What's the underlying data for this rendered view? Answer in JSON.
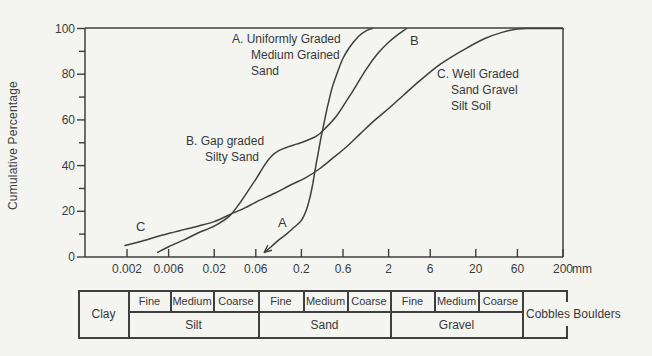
{
  "chart": {
    "ylabel": "Cumulative Percentage",
    "x_unit": "mm",
    "curve_letters": {
      "a": "A",
      "b": "B",
      "c": "C"
    },
    "labels": {
      "a_line1": "A. Uniformly Graded",
      "a_line2": "Medium Grained",
      "a_line3": "Sand",
      "b_line1": "B. Gap graded",
      "b_line2": "Silty Sand",
      "c_line1": "C. Well Graded",
      "c_line2": "Sand Gravel",
      "c_line3": "Silt Soil"
    }
  },
  "chart_data": {
    "type": "line",
    "title": "",
    "xlabel": "mm",
    "ylabel": "Cumulative Percentage",
    "x_scale": "log",
    "xlim": [
      0.00066,
      216
    ],
    "ylim": [
      0,
      100
    ],
    "grid": false,
    "x_ticks": [
      0.002,
      0.006,
      0.02,
      0.06,
      0.2,
      0.6,
      2,
      6,
      20,
      60,
      200
    ],
    "x_tick_labels": [
      "0.002",
      "0.006",
      "0.02",
      "0.06",
      "0.2",
      "0.6",
      "2",
      "6",
      "20",
      "60",
      "200"
    ],
    "y_major_ticks": [
      0,
      20,
      40,
      60,
      80,
      100
    ],
    "y_minor_step": 10,
    "series": [
      {
        "name": "A",
        "label": "A. Uniformly Graded Medium Grained Sand",
        "arrow_at_start": true,
        "points": [
          [
            0.075,
            2
          ],
          [
            0.09,
            4.5
          ],
          [
            0.11,
            7.5
          ],
          [
            0.135,
            10
          ],
          [
            0.165,
            13
          ],
          [
            0.2,
            16
          ],
          [
            0.23,
            21
          ],
          [
            0.25,
            26
          ],
          [
            0.27,
            32
          ],
          [
            0.29,
            39
          ],
          [
            0.31,
            45
          ],
          [
            0.335,
            52
          ],
          [
            0.365,
            59
          ],
          [
            0.4,
            66
          ],
          [
            0.45,
            74
          ],
          [
            0.52,
            81
          ],
          [
            0.6,
            87
          ],
          [
            0.72,
            92
          ],
          [
            0.9,
            96.5
          ],
          [
            1.1,
            99
          ],
          [
            1.3,
            100
          ]
        ]
      },
      {
        "name": "B",
        "label": "B. Gap graded Silty Sand",
        "arrow_at_start": false,
        "points": [
          [
            0.0045,
            2
          ],
          [
            0.006,
            4.5
          ],
          [
            0.009,
            7.5
          ],
          [
            0.013,
            10.5
          ],
          [
            0.02,
            13.5
          ],
          [
            0.03,
            18
          ],
          [
            0.04,
            24
          ],
          [
            0.05,
            29.5
          ],
          [
            0.06,
            34
          ],
          [
            0.075,
            40
          ],
          [
            0.09,
            44
          ],
          [
            0.11,
            46.5
          ],
          [
            0.14,
            48.2
          ],
          [
            0.18,
            49.5
          ],
          [
            0.23,
            51
          ],
          [
            0.3,
            53
          ],
          [
            0.38,
            56.5
          ],
          [
            0.5,
            61.5
          ],
          [
            0.65,
            68
          ],
          [
            0.85,
            75
          ],
          [
            1.1,
            82
          ],
          [
            1.5,
            89
          ],
          [
            2,
            94
          ],
          [
            2.6,
            97.5
          ],
          [
            3.2,
            100
          ]
        ]
      },
      {
        "name": "C",
        "label": "C. Well Graded Sand Gravel Silt Soil",
        "arrow_at_start": false,
        "points": [
          [
            0.0019,
            5
          ],
          [
            0.003,
            7
          ],
          [
            0.005,
            9.5
          ],
          [
            0.008,
            11.5
          ],
          [
            0.013,
            13.5
          ],
          [
            0.02,
            15.5
          ],
          [
            0.03,
            18.5
          ],
          [
            0.045,
            21.5
          ],
          [
            0.06,
            24
          ],
          [
            0.1,
            28
          ],
          [
            0.15,
            31.5
          ],
          [
            0.22,
            34.5
          ],
          [
            0.32,
            38.5
          ],
          [
            0.45,
            43
          ],
          [
            0.65,
            48
          ],
          [
            0.95,
            54
          ],
          [
            1.4,
            60
          ],
          [
            2,
            65
          ],
          [
            3,
            71
          ],
          [
            4.5,
            77
          ],
          [
            7,
            83
          ],
          [
            10,
            87
          ],
          [
            15,
            91
          ],
          [
            25,
            95.5
          ],
          [
            40,
            98.3
          ],
          [
            60,
            99.8
          ],
          [
            90,
            100
          ],
          [
            200,
            100
          ]
        ]
      }
    ]
  },
  "size_table": {
    "clay": "Clay",
    "groups": [
      {
        "name": "Silt",
        "subs": [
          "Fine",
          "Medium",
          "Coarse"
        ]
      },
      {
        "name": "Sand",
        "subs": [
          "Fine",
          "Medium",
          "Coarse"
        ]
      },
      {
        "name": "Gravel",
        "subs": [
          "Fine",
          "Medium",
          "Coarse"
        ]
      }
    ],
    "cobbles": "Cobbles Boulders"
  },
  "colors": {
    "ink": "#3f3f3f",
    "paper": "#f4f4f1"
  }
}
